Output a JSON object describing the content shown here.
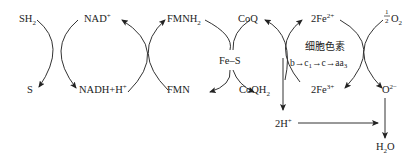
{
  "diagram": {
    "type": "electron-transport-chain",
    "nodes": {
      "sh2": {
        "label": "SH",
        "sub": "2"
      },
      "s": {
        "label": "S"
      },
      "nad_plus": {
        "label": "NAD",
        "sup": "+"
      },
      "nadh": {
        "label": "NADH+H",
        "sup": "+"
      },
      "fmnh2": {
        "label": "FMNH",
        "sub": "2"
      },
      "fmn": {
        "label": "FMN"
      },
      "fe_s": {
        "label": "Fe–S"
      },
      "coq": {
        "label": "CoQ"
      },
      "coqh2": {
        "label": "CoQH",
        "sub": "2"
      },
      "fe2": {
        "label": "2Fe",
        "sup": "2+"
      },
      "fe3": {
        "label": "2Fe",
        "sup": "3+"
      },
      "cytochrome_title": {
        "label": "细胞色素"
      },
      "cytochrome_chain": {
        "b": "b",
        "c1": "c",
        "c1_sub": "1",
        "c": "c",
        "aa3": "aa",
        "aa3_sub": "3",
        "arrow": "→"
      },
      "half_o2": {
        "num": "1",
        "den": "2",
        "label": "O",
        "sub": "2"
      },
      "o2minus": {
        "label": "O",
        "sup": "2−"
      },
      "two_h_plus": {
        "label": "2H",
        "sup": "+"
      },
      "h2o": {
        "label": "H",
        "sub": "2",
        "label2": "O"
      }
    },
    "edges": [
      {
        "from": "SH2",
        "to": "S"
      },
      {
        "from": "NADH+H+",
        "to": "NAD+"
      },
      {
        "from": "NAD+",
        "to": "NADH+H+"
      },
      {
        "from": "FMN",
        "to": "FMNH2"
      },
      {
        "from": "FMNH2",
        "to": "FMN"
      },
      {
        "from": "CoQ",
        "to": "CoQH2"
      },
      {
        "from": "CoQH2",
        "to": "CoQ"
      },
      {
        "from": "2Fe3+",
        "to": "2Fe2+"
      },
      {
        "from": "2Fe2+",
        "to": "2Fe3+"
      },
      {
        "from": "1/2 O2",
        "to": "O2-"
      },
      {
        "from": "CoQH2",
        "to": "2H+"
      },
      {
        "from": "2H+",
        "to": "H2O"
      },
      {
        "from": "O2-",
        "to": "H2O"
      }
    ]
  }
}
